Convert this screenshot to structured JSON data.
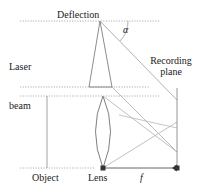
{
  "figure": {
    "width": 201,
    "height": 192,
    "colors": {
      "stroke": "#5a5a5a",
      "text": "#1a1a1a",
      "background": "#ffffff",
      "ray": "#a9a9a9",
      "dotted": "#8c8c8c"
    }
  },
  "labels": {
    "deflection": "Deflection",
    "alpha": "α",
    "laser": "Laser",
    "recording_plane": "Recording plane",
    "beam": "beam",
    "object": "Object",
    "lens": "Lens",
    "focal_length": "f"
  },
  "geometry": {
    "deflection_point": {
      "x": 100,
      "y": 21
    },
    "lens_center": {
      "x": 103,
      "y": 131
    },
    "lens_top": {
      "x": 103,
      "y": 96
    },
    "lens_bottom": {
      "x": 103,
      "y": 168
    },
    "object_line_x": 47,
    "recording_plane_x": 177,
    "optical_axis_y": 168,
    "dotted_lines_y": [
      21,
      87,
      96,
      168
    ],
    "angle_alpha_arc_radius": 22
  }
}
